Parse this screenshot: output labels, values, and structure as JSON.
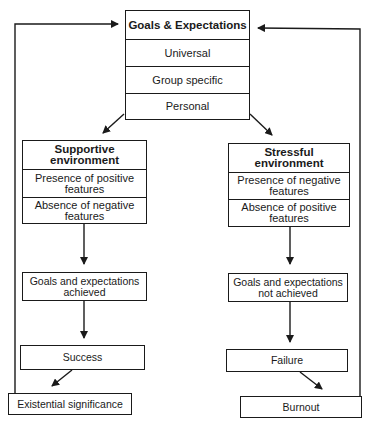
{
  "top_box": {
    "title": "Goals & Expectations",
    "rows": [
      "Universal",
      "Group specific",
      "Personal"
    ]
  },
  "left_branch": {
    "title_line1": "Supportive",
    "title_line2": "environment",
    "rows": [
      {
        "line1": "Presence of positive",
        "line2": "features"
      },
      {
        "line1": "Absence of negative",
        "line2": "features"
      }
    ],
    "outcome": {
      "line1": "Goals and expectations",
      "line2": "achieved"
    },
    "result": "Success",
    "final": "Existential significance"
  },
  "right_branch": {
    "title_line1": "Stressful",
    "title_line2": "environment",
    "rows": [
      {
        "line1": "Presence of negative",
        "line2": "features"
      },
      {
        "line1": "Absence of positive",
        "line2": "features"
      }
    ],
    "outcome": {
      "line1": "Goals and expectations",
      "line2": "not achieved"
    },
    "result": "Failure",
    "final": "Burnout"
  },
  "colors": {
    "line": "#1a1a1a",
    "background": "#ffffff"
  }
}
